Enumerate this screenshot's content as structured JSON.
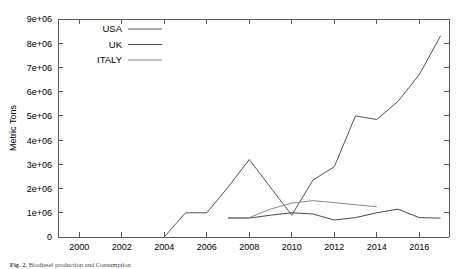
{
  "figure": {
    "caption_prefix": "Fig. 2.",
    "caption_text": "Biodiesel production and Consumption"
  },
  "chart_data": {
    "type": "line",
    "title": "",
    "xlabel": "",
    "ylabel": "Metric Tons",
    "xlim": [
      1999,
      2017.4
    ],
    "ylim": [
      0,
      9000000
    ],
    "grid": false,
    "legend_position": "top-left-inside",
    "xticks": [
      "2000",
      "2002",
      "2004",
      "2006",
      "2008",
      "2010",
      "2012",
      "2014",
      "2016"
    ],
    "xtick_values": [
      2000,
      2002,
      2004,
      2006,
      2008,
      2010,
      2012,
      2014,
      2016
    ],
    "yticks": [
      "0",
      "1e+06",
      "2e+06",
      "3e+06",
      "4e+06",
      "5e+06",
      "6e+06",
      "7e+06",
      "8e+06",
      "9e+06"
    ],
    "ytick_values": [
      0,
      1000000,
      2000000,
      3000000,
      4000000,
      5000000,
      6000000,
      7000000,
      8000000,
      9000000
    ],
    "series": [
      {
        "name": "USA",
        "color": "#555555",
        "x": [
          2004,
          2005,
          2006,
          2007,
          2008,
          2009,
          2010,
          2011,
          2012,
          2013,
          2014,
          2015,
          2016,
          2017
        ],
        "values": [
          0,
          1000000,
          1000000,
          2050000,
          3200000,
          2050000,
          900000,
          2350000,
          2900000,
          5000000,
          4850000,
          5600000,
          6700000,
          8300000
        ]
      },
      {
        "name": "UK",
        "color": "#4a4a4a",
        "x": [
          2007,
          2008,
          2009,
          2010,
          2011,
          2012,
          2013,
          2014,
          2015,
          2016,
          2017
        ],
        "values": [
          780000,
          780000,
          900000,
          1000000,
          950000,
          700000,
          800000,
          1000000,
          1150000,
          800000,
          780000
        ]
      },
      {
        "name": "ITALY",
        "color": "#8a8a8a",
        "x": [
          2007,
          2008,
          2009,
          2010,
          2011,
          2012,
          2013,
          2014
        ],
        "values": [
          800000,
          800000,
          1150000,
          1400000,
          1500000,
          1420000,
          1330000,
          1250000
        ]
      }
    ]
  }
}
